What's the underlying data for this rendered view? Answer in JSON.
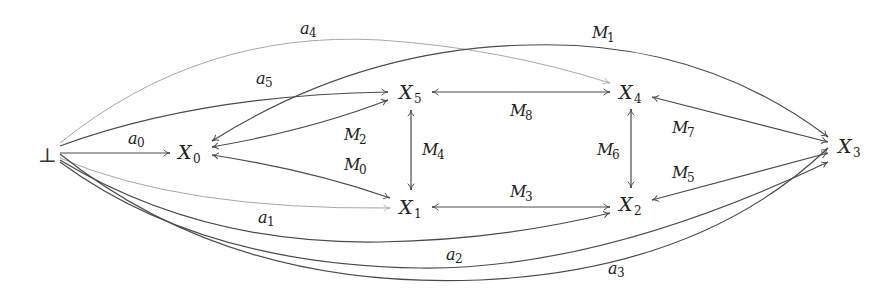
{
  "diagram": {
    "type": "directed-graph",
    "bottom_node": {
      "id": "bot",
      "label": "⊥"
    },
    "nodes": [
      {
        "id": "X0",
        "base": "X",
        "sub": "0"
      },
      {
        "id": "X1",
        "base": "X",
        "sub": "1"
      },
      {
        "id": "X2",
        "base": "X",
        "sub": "2"
      },
      {
        "id": "X3",
        "base": "X",
        "sub": "3"
      },
      {
        "id": "X4",
        "base": "X",
        "sub": "4"
      },
      {
        "id": "X5",
        "base": "X",
        "sub": "5"
      }
    ],
    "edges": [
      {
        "id": "a0",
        "base": "a",
        "sub": "0",
        "from": "⊥",
        "to": "X0",
        "direction": "forward"
      },
      {
        "id": "a1",
        "base": "a",
        "sub": "1",
        "from": "⊥",
        "to": "X2",
        "direction": "forward"
      },
      {
        "id": "a1_light",
        "base": "",
        "sub": "",
        "from": "⊥",
        "to": "X1",
        "direction": "forward",
        "style": "light"
      },
      {
        "id": "a2",
        "base": "a",
        "sub": "2",
        "from": "⊥",
        "to": "X3",
        "direction": "forward"
      },
      {
        "id": "a3",
        "base": "a",
        "sub": "3",
        "from": "⊥",
        "to": "X3",
        "direction": "forward"
      },
      {
        "id": "a4",
        "base": "a",
        "sub": "4",
        "from": "⊥",
        "to": "X4",
        "direction": "forward",
        "style": "light"
      },
      {
        "id": "a5",
        "base": "a",
        "sub": "5",
        "from": "⊥",
        "to": "X5",
        "direction": "forward"
      },
      {
        "id": "M0",
        "base": "M",
        "sub": "0",
        "from": "X0",
        "to": "X1",
        "direction": "both"
      },
      {
        "id": "M1",
        "base": "M",
        "sub": "1",
        "from": "X0",
        "to": "X3",
        "direction": "both"
      },
      {
        "id": "M2",
        "base": "M",
        "sub": "2",
        "from": "X0",
        "to": "X5",
        "direction": "both"
      },
      {
        "id": "M3",
        "base": "M",
        "sub": "3",
        "from": "X1",
        "to": "X2",
        "direction": "both"
      },
      {
        "id": "M4",
        "base": "M",
        "sub": "4",
        "from": "X5",
        "to": "X1",
        "direction": "both"
      },
      {
        "id": "M5",
        "base": "M",
        "sub": "5",
        "from": "X2",
        "to": "X3",
        "direction": "both"
      },
      {
        "id": "M6",
        "base": "M",
        "sub": "6",
        "from": "X4",
        "to": "X2",
        "direction": "both"
      },
      {
        "id": "M7",
        "base": "M",
        "sub": "7",
        "from": "X4",
        "to": "X3",
        "direction": "both"
      },
      {
        "id": "M8",
        "base": "M",
        "sub": "8",
        "from": "X5",
        "to": "X4",
        "direction": "both"
      }
    ]
  }
}
